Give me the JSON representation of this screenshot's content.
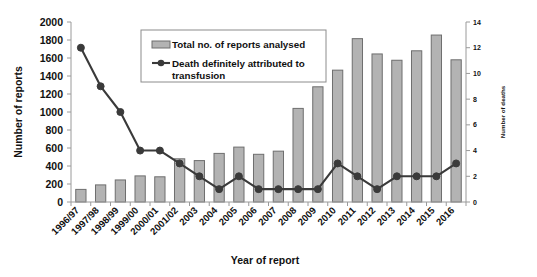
{
  "chart_data": {
    "type": "bar",
    "title": "",
    "xlabel": "Year of report",
    "ylabel": "Number of reports",
    "y2label": "Number of deaths",
    "ylim": [
      0,
      2000
    ],
    "y2lim": [
      0,
      14
    ],
    "yticks": [
      0,
      200,
      400,
      600,
      800,
      1000,
      1200,
      1400,
      1600,
      1800,
      2000
    ],
    "y2ticks": [
      0,
      2,
      4,
      6,
      8,
      10,
      12,
      14
    ],
    "grid": false,
    "legend_position": "top-center",
    "categories": [
      "1996/97",
      "1997/98",
      "1998/99",
      "1999/00",
      "2000/01",
      "2001/02",
      "2003",
      "2004",
      "2005",
      "2006",
      "2007",
      "2008",
      "2009",
      "2010",
      "2011",
      "2012",
      "2013",
      "2014",
      "2015",
      "2016"
    ],
    "series": [
      {
        "name": "Total no. of reports analysed",
        "type": "bar",
        "axis": "left",
        "color": "#b3b3b3",
        "edge_color": "#6e6e6e",
        "values": [
          140,
          190,
          245,
          290,
          280,
          480,
          460,
          540,
          610,
          530,
          565,
          1040,
          1280,
          1465,
          1815,
          1645,
          1575,
          1680,
          1855,
          1580
        ]
      },
      {
        "name": "Death definitely attributed to transfusion",
        "type": "line",
        "axis": "right",
        "color": "#3a3a3a",
        "marker": "circle",
        "values": [
          12,
          9,
          7,
          4,
          4,
          3,
          2,
          1,
          2,
          1,
          1,
          1,
          1,
          3,
          2,
          1,
          2,
          2,
          2,
          3
        ]
      }
    ]
  },
  "legend": {
    "entries": [
      {
        "label": "Total no. of reports analysed",
        "swatch": "bar-swatch"
      },
      {
        "label": "Death definitely attributed to",
        "label2": "transfusion",
        "swatch": "line-marker-swatch"
      }
    ]
  },
  "axes": {
    "left_title": "Number of reports",
    "right_title": "Number of deaths",
    "bottom_title": "Year of report"
  }
}
